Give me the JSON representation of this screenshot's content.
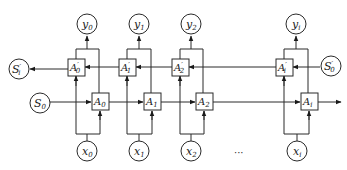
{
  "diagram": {
    "type": "bidirectional-rnn",
    "ellipsis": "···",
    "columns": [
      {
        "y": "y",
        "y_sub": "0",
        "x": "x",
        "x_sub": "0",
        "fwd": "A",
        "fwd_sub": "0",
        "bwd": "A",
        "bwd_sub": "0",
        "bwd_prime": "′"
      },
      {
        "y": "y",
        "y_sub": "1",
        "x": "x",
        "x_sub": "1",
        "fwd": "A",
        "fwd_sub": "1",
        "bwd": "A",
        "bwd_sub": "1",
        "bwd_prime": "′"
      },
      {
        "y": "y",
        "y_sub": "2",
        "x": "x",
        "x_sub": "2",
        "fwd": "A",
        "fwd_sub": "2",
        "bwd": "A",
        "bwd_sub": "2",
        "bwd_prime": "′"
      },
      {
        "y": "y",
        "y_sub": "i",
        "x": "x",
        "x_sub": "i",
        "fwd": "A",
        "fwd_sub": "i",
        "bwd": "A",
        "bwd_sub": "i",
        "bwd_prime": "′"
      }
    ],
    "states": {
      "s_prime_i": {
        "base": "S",
        "sub": "i",
        "prime": "′"
      },
      "s_prime_0": {
        "base": "S",
        "sub": "0",
        "prime": "′"
      },
      "s_0": {
        "base": "S",
        "sub": "0"
      },
      "s_i": {
        "base": "S",
        "sub": "i"
      }
    }
  }
}
